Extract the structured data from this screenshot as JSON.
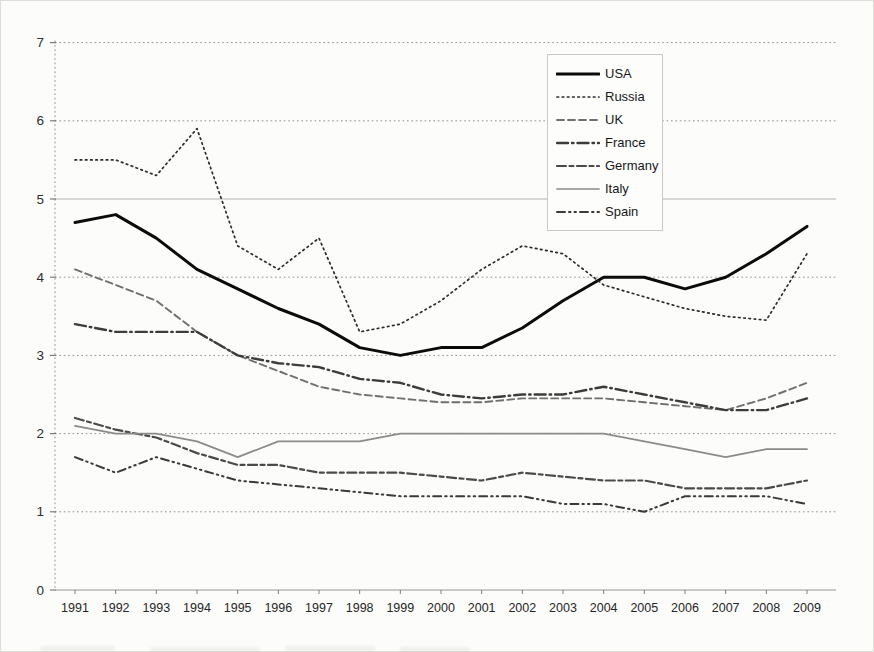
{
  "page": {
    "background": "#fcfcfa",
    "note": "scanned book figure, caption cut off at bottom edge (illegible)"
  },
  "chart_data": {
    "type": "line",
    "title": "",
    "xlabel": "",
    "ylabel": "",
    "x": [
      "1991",
      "1992",
      "1993",
      "1994",
      "1995",
      "1996",
      "1997",
      "1998",
      "1999",
      "2000",
      "2001",
      "2002",
      "2003",
      "2004",
      "2005",
      "2006",
      "2007",
      "2008",
      "2009"
    ],
    "y_ticks": [
      "0",
      "1",
      "2",
      "3",
      "4",
      "5",
      "6",
      "7"
    ],
    "ylim": [
      0,
      7
    ],
    "grid": "horizontal dotted gray; line at 5 solid",
    "legend_position": "inside top-center, bordered white box",
    "series": [
      {
        "name": "USA",
        "line_style": "solid-thick",
        "color": "#0b0b0b",
        "width": 3,
        "dash": "",
        "values": [
          4.7,
          4.8,
          4.5,
          4.1,
          3.85,
          3.6,
          3.4,
          3.1,
          3.0,
          3.1,
          3.1,
          3.35,
          3.7,
          4.0,
          4.0,
          3.85,
          4.0,
          4.3,
          4.65
        ]
      },
      {
        "name": "Russia",
        "line_style": "dotted",
        "color": "#2b2b2b",
        "width": 1.7,
        "dash": "1.6 3.6",
        "values": [
          5.5,
          5.5,
          5.3,
          5.9,
          4.4,
          4.1,
          4.5,
          3.3,
          3.4,
          3.7,
          4.1,
          4.4,
          4.3,
          3.9,
          3.75,
          3.6,
          3.5,
          3.45,
          4.3
        ]
      },
      {
        "name": "UK",
        "line_style": "dashed",
        "color": "#6f6f6f",
        "width": 1.9,
        "dash": "7 4",
        "values": [
          4.1,
          3.9,
          3.7,
          3.3,
          3.0,
          2.8,
          2.6,
          2.5,
          2.45,
          2.4,
          2.4,
          2.45,
          2.45,
          2.45,
          2.4,
          2.35,
          2.3,
          2.45,
          2.65
        ]
      },
      {
        "name": "France",
        "line_style": "dash-dot",
        "color": "#3c3c3c",
        "width": 2.4,
        "dash": "11 4 1.5 4",
        "values": [
          3.4,
          3.3,
          3.3,
          3.3,
          3.0,
          2.9,
          2.85,
          2.7,
          2.65,
          2.5,
          2.45,
          2.5,
          2.5,
          2.6,
          2.5,
          2.4,
          2.3,
          2.3,
          2.45
        ]
      },
      {
        "name": "Germany",
        "line_style": "long-short-dash",
        "color": "#4a4a4a",
        "width": 2.2,
        "dash": "9 3.5 4 3.5",
        "values": [
          2.2,
          2.05,
          1.95,
          1.75,
          1.6,
          1.6,
          1.5,
          1.5,
          1.5,
          1.45,
          1.4,
          1.5,
          1.45,
          1.4,
          1.4,
          1.3,
          1.3,
          1.3,
          1.4
        ]
      },
      {
        "name": "Italy",
        "line_style": "solid-thin",
        "color": "#8a8a8a",
        "width": 1.7,
        "dash": "",
        "values": [
          2.1,
          2.0,
          2.0,
          1.9,
          1.7,
          1.9,
          1.9,
          1.9,
          2.0,
          2.0,
          2.0,
          2.0,
          2.0,
          2.0,
          1.9,
          1.8,
          1.7,
          1.8,
          1.8
        ]
      },
      {
        "name": "Spain",
        "line_style": "dash-dot-dot",
        "color": "#3a3a3a",
        "width": 2.0,
        "dash": "8 4 1.5 4 1.5 4",
        "values": [
          1.7,
          1.5,
          1.7,
          1.55,
          1.4,
          1.35,
          1.3,
          1.25,
          1.2,
          1.2,
          1.2,
          1.2,
          1.1,
          1.1,
          1.0,
          1.2,
          1.2,
          1.2,
          1.1
        ]
      }
    ]
  }
}
